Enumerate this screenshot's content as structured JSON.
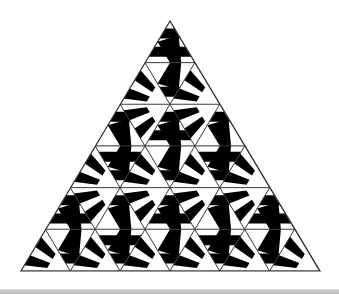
{
  "figure": {
    "apex": [
      170,
      21
    ],
    "base_left": [
      21,
      271
    ],
    "base_right": [
      320,
      271
    ],
    "rows": 6,
    "colors": {
      "ink": "#000000",
      "paper": "#ffffff",
      "outline": "#333333",
      "bottom_bar": "#c4c4c4"
    },
    "tile_patterns": [
      [
        0
      ],
      [
        1,
        2,
        1
      ],
      [
        2,
        1,
        0,
        1,
        2
      ],
      [
        1,
        0,
        1,
        2,
        1,
        0,
        1
      ],
      [
        0,
        1,
        2,
        1,
        0,
        1,
        2,
        1,
        0
      ],
      [
        1,
        2,
        1,
        0,
        1,
        2,
        1,
        0,
        1,
        2,
        1
      ]
    ]
  }
}
